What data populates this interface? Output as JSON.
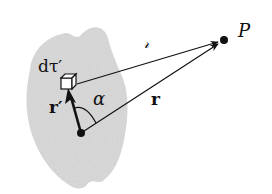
{
  "figure": {
    "colors": {
      "background": "#ffffff",
      "blob": "#d9d9d9",
      "ink": "#111111"
    },
    "labels": {
      "volume_element": "dτ′",
      "separation": "𝓇",
      "field_point": "P",
      "source_vector": "r′",
      "field_vector": "r",
      "angle": "α"
    },
    "points": {
      "origin": [
        81,
        133
      ],
      "field_point": [
        224,
        40
      ],
      "volume_element": [
        69,
        82
      ]
    }
  }
}
